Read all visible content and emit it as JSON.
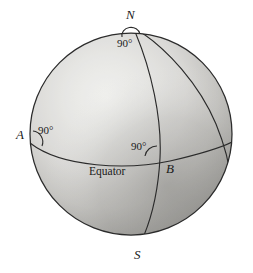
{
  "figure": {
    "background_color": "#ffffff",
    "ink_color": "#1a1a1a"
  },
  "sphere": {
    "center_x": 131,
    "center_y": 134,
    "radius": 101,
    "outline_color": "#2b2b2b",
    "fill_highlight_color": "#f2f2f0",
    "fill_mid_color": "#c9c9c6",
    "fill_shadow_color": "#8e8e8c"
  },
  "points": {
    "north_pole": {
      "label": "N",
      "x": 133,
      "y": 27
    },
    "south_pole": {
      "label": "S",
      "x": 142,
      "y": 240
    },
    "point_a": {
      "label": "A",
      "x": 30,
      "y": 143
    },
    "point_b": {
      "label": "B",
      "x": 160,
      "y": 158
    }
  },
  "curves": {
    "equator_label": "Equator",
    "equator_color": "#2b2b2b",
    "meridian_color": "#2b2b2b"
  },
  "angles": [
    {
      "id": "angle-at-n",
      "value": "90°",
      "vertex": "N"
    },
    {
      "id": "angle-at-a",
      "value": "90°",
      "vertex": "A"
    },
    {
      "id": "angle-at-b",
      "value": "90°",
      "vertex": "B"
    }
  ]
}
